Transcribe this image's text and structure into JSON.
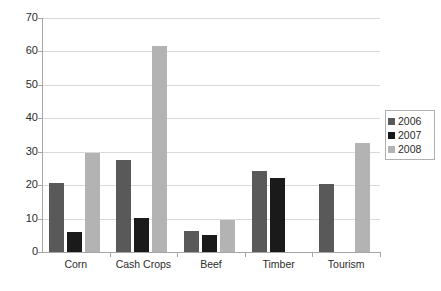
{
  "chart_data": {
    "type": "bar",
    "title": "",
    "xlabel": "",
    "ylabel": "",
    "ylim": [
      0,
      70
    ],
    "ytick_step": 10,
    "yticks": [
      70,
      60,
      50,
      40,
      30,
      20,
      10,
      0
    ],
    "grid": true,
    "legend_position": "right",
    "categories": [
      "Corn",
      "Cash Crops",
      "Beef",
      "Timber",
      "Tourism"
    ],
    "series": [
      {
        "name": "2006",
        "color": "#595959",
        "values": [
          20.5,
          27.5,
          6.2,
          24.2,
          20.3
        ]
      },
      {
        "name": "2007",
        "color": "#1a1a1a",
        "values": [
          6.0,
          10.2,
          5.0,
          22.2,
          null
        ]
      },
      {
        "name": "2008",
        "color": "#b3b3b3",
        "values": [
          29.5,
          61.5,
          9.5,
          null,
          32.7
        ]
      }
    ]
  },
  "legend": {
    "items": [
      {
        "label": "2006",
        "color": "#595959"
      },
      {
        "label": "2007",
        "color": "#1a1a1a"
      },
      {
        "label": "2008",
        "color": "#b3b3b3"
      }
    ]
  },
  "axes": {
    "y_tick_labels": [
      "70",
      "60",
      "50",
      "40",
      "30",
      "20",
      "10",
      "0"
    ],
    "x_tick_labels": [
      "Corn",
      "Cash Crops",
      "Beef",
      "Timber",
      "Tourism"
    ]
  }
}
